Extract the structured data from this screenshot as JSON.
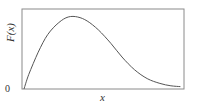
{
  "chart_data": {
    "type": "line",
    "title": "",
    "xlabel": "x",
    "ylabel": "F(x)",
    "y_ticks": [
      "0"
    ],
    "x_ticks": [],
    "grid": false,
    "legend": null,
    "ylim": [
      0,
      1
    ],
    "xlim": [
      0,
      1
    ],
    "series": [
      {
        "name": "F(x)",
        "x": [
          0.0,
          0.03,
          0.09,
          0.15,
          0.22,
          0.28,
          0.34,
          0.4,
          0.47,
          0.55,
          0.62,
          0.7,
          0.78,
          0.86,
          0.93,
          0.99
        ],
        "values": [
          0.0,
          0.18,
          0.46,
          0.68,
          0.83,
          0.9,
          0.9,
          0.85,
          0.74,
          0.57,
          0.4,
          0.24,
          0.13,
          0.07,
          0.04,
          0.03
        ]
      }
    ],
    "color": "#555555",
    "frame_color": "#888888"
  },
  "labels": {
    "y_axis": "F(x)",
    "x_axis": "x",
    "origin": "0"
  }
}
